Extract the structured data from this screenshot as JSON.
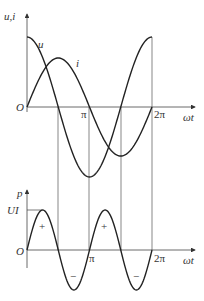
{
  "top_graph": {
    "y_label": "u,i",
    "x_label": "ωt",
    "origin_label": "O",
    "ticks": [
      "π",
      "2π"
    ],
    "curves": [
      {
        "name": "u",
        "label": "u",
        "type": "cosine"
      },
      {
        "name": "i",
        "label": "i",
        "type": "sine"
      }
    ]
  },
  "bottom_graph": {
    "y_label": "p",
    "x_label": "ωt",
    "origin_label": "O",
    "y_tick": "UI",
    "ticks": [
      "π",
      "2π"
    ],
    "signs": [
      "+",
      "−",
      "+",
      "−"
    ]
  },
  "chart_data": [
    {
      "type": "line",
      "title": "",
      "xlabel": "ωt",
      "ylabel": "u,i",
      "x": [
        "0",
        "π/2",
        "π",
        "3π/2",
        "2π"
      ],
      "series": [
        {
          "name": "u",
          "values": [
            1,
            0,
            -1,
            0,
            1
          ]
        },
        {
          "name": "i",
          "values": [
            0,
            0.7,
            0,
            -0.7,
            0
          ]
        }
      ]
    },
    {
      "type": "line",
      "title": "",
      "xlabel": "ωt",
      "ylabel": "p",
      "x": [
        "0",
        "π/4",
        "π/2",
        "3π/4",
        "π",
        "5π/4",
        "3π/2",
        "7π/4",
        "2π"
      ],
      "series": [
        {
          "name": "p",
          "values": [
            0,
            1,
            0,
            -1,
            0,
            1,
            0,
            -1,
            0
          ]
        }
      ]
    }
  ]
}
